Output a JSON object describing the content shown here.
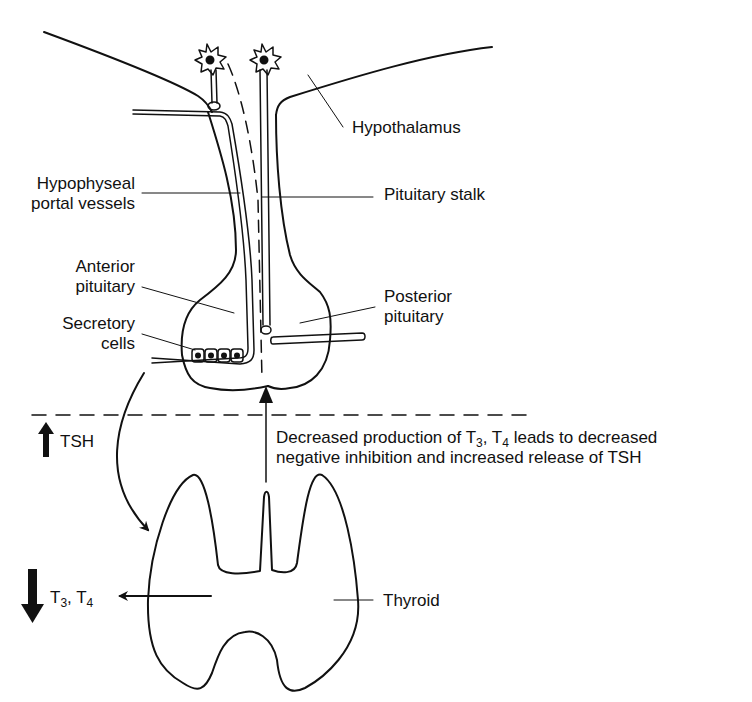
{
  "labels": {
    "hypothalamus": "Hypothalamus",
    "pituitary_stalk": "Pituitary stalk",
    "hypophyseal_line1": "Hypophyseal",
    "hypophyseal_line2": "portal vessels",
    "anterior_line1": "Anterior",
    "anterior_line2": "pituitary",
    "secretory_line1": "Secretory",
    "secretory_line2": "cells",
    "posterior_line1": "Posterior",
    "posterior_line2": "pituitary",
    "thyroid": "Thyroid",
    "tsh": "TSH",
    "t3_prefix": "T",
    "t3_sub": "3",
    "t4_sep": ", T",
    "t4_sub": "4"
  },
  "feedback_text": {
    "line1_a": "Decreased production of  T",
    "line1_sub3": "3",
    "line1_b": ", T",
    "line1_sub4": "4",
    "line1_c": " leads to decreased",
    "line2": "negative inhibition and increased release of TSH"
  },
  "indicators": {
    "tsh_direction": "up",
    "t3_t4_direction": "down"
  },
  "colors": {
    "stroke": "#111111",
    "background": "#ffffff"
  }
}
